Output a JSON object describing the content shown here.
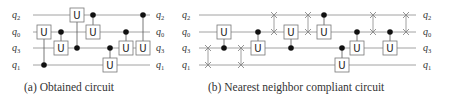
{
  "colors": {
    "wire": "#8a8a8a",
    "gate_border": "#777777",
    "control": "#111111",
    "swap": "#888888",
    "text": "#333333"
  },
  "wire_order": [
    "q2",
    "q0",
    "q3",
    "q1"
  ],
  "wire_y": {
    "q2": 15,
    "q0": 32,
    "q3": 48,
    "q1": 65
  },
  "circuits": [
    {
      "id": "a",
      "caption": "(a) Obtained circuit",
      "caption_x": 24,
      "input_label_x": 12,
      "output_label_x": 156,
      "wire_x0": 33,
      "wire_x1": 150,
      "labels": [
        {
          "base": "q",
          "sub": "2",
          "wire": "q2"
        },
        {
          "base": "q",
          "sub": "0",
          "wire": "q0"
        },
        {
          "base": "q",
          "sub": "3",
          "wire": "q3"
        },
        {
          "base": "q",
          "sub": "1",
          "wire": "q1"
        }
      ],
      "gates": [
        {
          "type": "cu",
          "x": 44,
          "control": "q1",
          "target": "q0",
          "label": "U"
        },
        {
          "type": "cu",
          "x": 61,
          "control": "q0",
          "target": "q3",
          "label": "U"
        },
        {
          "type": "cu",
          "x": 77,
          "control": "q3",
          "target": "q2",
          "label": "U"
        },
        {
          "type": "cu",
          "x": 93,
          "control": "q2",
          "target": "q0",
          "label": "U"
        },
        {
          "type": "cu",
          "x": 110,
          "control": "q3",
          "target": "q1",
          "label": "U"
        },
        {
          "type": "cu",
          "x": 126,
          "control": "q0",
          "target": "q3",
          "label": "U"
        },
        {
          "type": "cu",
          "x": 143,
          "control": "q2",
          "target": "q3",
          "label": "U"
        }
      ]
    },
    {
      "id": "b",
      "caption": "(b) Nearest neighbor compliant circuit",
      "caption_x": 208,
      "input_label_x": 182,
      "output_label_x": 423,
      "wire_x0": 199,
      "wire_x1": 416,
      "labels": [
        {
          "base": "q",
          "sub": "2",
          "wire": "q2"
        },
        {
          "base": "q",
          "sub": "0",
          "wire": "q0"
        },
        {
          "base": "q",
          "sub": "3",
          "wire": "q3"
        },
        {
          "base": "q",
          "sub": "1",
          "wire": "q1"
        }
      ],
      "gates": [
        {
          "type": "swap",
          "x": 208,
          "a": "q3",
          "b": "q1"
        },
        {
          "type": "cu",
          "x": 224,
          "control": "q3",
          "target": "q0",
          "label": "U"
        },
        {
          "type": "swap",
          "x": 241,
          "a": "q3",
          "b": "q1"
        },
        {
          "type": "cu",
          "x": 258,
          "control": "q0",
          "target": "q3",
          "label": "U"
        },
        {
          "type": "swap",
          "x": 274,
          "a": "q2",
          "b": "q0"
        },
        {
          "type": "cu",
          "x": 291,
          "control": "q3",
          "target": "q0",
          "label": "U"
        },
        {
          "type": "swap",
          "x": 308,
          "a": "q2",
          "b": "q0"
        },
        {
          "type": "cu",
          "x": 324,
          "control": "q2",
          "target": "q0",
          "label": "U"
        },
        {
          "type": "cu",
          "x": 342,
          "control": "q3",
          "target": "q1",
          "label": "U"
        },
        {
          "type": "cu",
          "x": 357,
          "control": "q0",
          "target": "q3",
          "label": "U"
        },
        {
          "type": "swap",
          "x": 373,
          "a": "q2",
          "b": "q0"
        },
        {
          "type": "cu",
          "x": 390,
          "control": "q0",
          "target": "q3",
          "label": "U"
        },
        {
          "type": "swap",
          "x": 406,
          "a": "q2",
          "b": "q0"
        }
      ]
    }
  ]
}
